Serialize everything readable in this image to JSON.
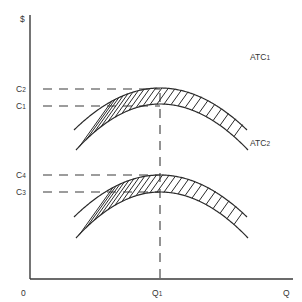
{
  "diagram": {
    "y_axis_label": "$",
    "x_axis_label": "Q",
    "origin_label": "0",
    "quantity_marker": {
      "label": "Q",
      "subscript": "1"
    },
    "cost_levels": [
      {
        "label": "C",
        "subscript": "2"
      },
      {
        "label": "C",
        "subscript": "1"
      },
      {
        "label": "C",
        "subscript": "4"
      },
      {
        "label": "C",
        "subscript": "3"
      }
    ],
    "curves": [
      {
        "label": "ATC",
        "subscript": "1",
        "band_upper_cost": "C2",
        "band_lower_cost": "C1"
      },
      {
        "label": "ATC",
        "subscript": "2",
        "band_upper_cost": "C4",
        "band_lower_cost": "C3"
      }
    ],
    "colors": {
      "ink": "#2a2a2a",
      "background": "#ffffff"
    }
  }
}
